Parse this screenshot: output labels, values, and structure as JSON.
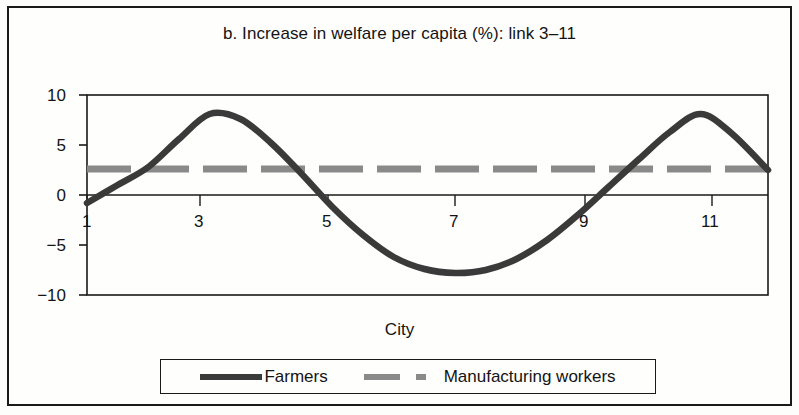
{
  "figure": {
    "title": "b. Increase in welfare per capita (%): link 3–11",
    "axis_title_x": "City"
  },
  "legend": {
    "items": [
      {
        "label": "Farmers",
        "style": "solid",
        "color": "#3a3a3a"
      },
      {
        "label": "Manufacturing workers",
        "style": "dashed",
        "color": "#8a8a8a"
      }
    ]
  },
  "axes": {
    "y_ticks": [
      "10",
      "5",
      "0",
      "−5",
      "−10"
    ],
    "x_ticks": [
      "1",
      "3",
      "5",
      "7",
      "9",
      "11"
    ]
  },
  "chart_data": {
    "type": "line",
    "title": "b. Increase in welfare per capita (%): link 3–11",
    "xlabel": "City",
    "ylabel": "",
    "xlim": [
      1,
      12.1
    ],
    "ylim": [
      -10,
      10
    ],
    "grid": false,
    "legend_position": "bottom",
    "x_tick_values": [
      1,
      3,
      5,
      7,
      9,
      11
    ],
    "y_tick_values": [
      10,
      5,
      0,
      -5,
      -10
    ],
    "x": [
      1,
      1.5,
      2,
      2.5,
      3,
      3.5,
      4,
      4.5,
      5,
      5.5,
      6,
      6.5,
      7,
      7.5,
      8,
      8.5,
      9,
      9.5,
      10,
      10.5,
      11,
      11.5,
      12.1
    ],
    "series": [
      {
        "name": "Farmers",
        "style": "solid",
        "color": "#3a3a3a",
        "values": [
          -0.8,
          1.0,
          2.8,
          5.6,
          8.1,
          7.6,
          5.2,
          2.1,
          -1.2,
          -4.0,
          -6.2,
          -7.4,
          -7.8,
          -7.5,
          -6.4,
          -4.5,
          -2.0,
          0.8,
          3.6,
          6.3,
          8.1,
          6.2,
          2.5
        ]
      },
      {
        "name": "Manufacturing workers",
        "style": "dashed",
        "color": "#8a8a8a",
        "constant_value": 2.6,
        "values": [
          2.6,
          2.6,
          2.6,
          2.6,
          2.6,
          2.6,
          2.6,
          2.6,
          2.6,
          2.6,
          2.6,
          2.6,
          2.6,
          2.6,
          2.6,
          2.6,
          2.6,
          2.6,
          2.6,
          2.6,
          2.6,
          2.6,
          2.6
        ]
      }
    ]
  }
}
